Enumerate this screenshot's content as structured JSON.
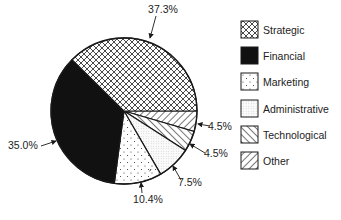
{
  "chart_data": {
    "type": "pie",
    "title": "",
    "categories": [
      "Strategic",
      "Financial",
      "Marketing",
      "Administrative",
      "Technological",
      "Other"
    ],
    "values": [
      37.3,
      35.0,
      10.4,
      7.5,
      4.5,
      4.5
    ],
    "labels": [
      "37.3%",
      "35.0%",
      "10.4%",
      "7.5%",
      "4.5%",
      "4.5%"
    ],
    "legend": {
      "position": "right",
      "entries": [
        {
          "label": "Strategic",
          "pattern": "crosshatch"
        },
        {
          "label": "Financial",
          "pattern": "solid-black"
        },
        {
          "label": "Marketing",
          "pattern": "sparse-dots"
        },
        {
          "label": "Administrative",
          "pattern": "fine-stipple"
        },
        {
          "label": "Technological",
          "pattern": "forward-diagonal"
        },
        {
          "label": "Other",
          "pattern": "backward-diagonal"
        }
      ]
    },
    "colors": {
      "ink": "#1a1a1a",
      "background": "#ffffff"
    }
  }
}
